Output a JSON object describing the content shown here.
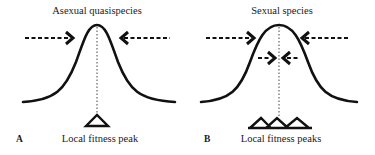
{
  "panels": [
    {
      "letter": "A",
      "title": "Asexual quasispecies",
      "caption": "Local fitness peak",
      "arrows": "outer pair converging on the peak",
      "peaks": 1
    },
    {
      "letter": "B",
      "title": "Sexual species",
      "caption": "Local fitness peaks",
      "arrows": "outer pair plus inner pair converging on the peak",
      "peaks": 3
    }
  ],
  "colors": {
    "line": "#111111",
    "background": "#ffffff"
  }
}
